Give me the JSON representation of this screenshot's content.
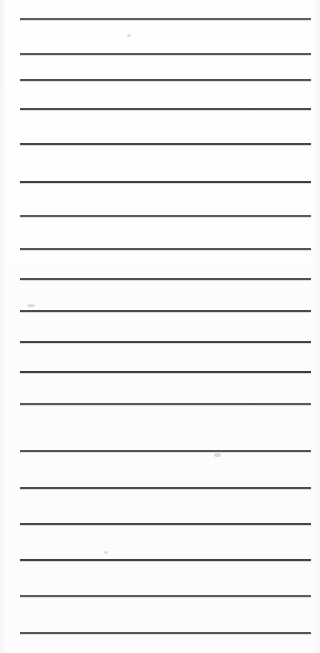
{
  "document": {
    "title": "Lined Notepaper Scan",
    "kind": "ruled-paper",
    "page_width": 320,
    "page_height": 653,
    "background_color": "#fefefe",
    "rule_color": "#3a3a3a",
    "text_content": "",
    "note": "Blank ruled sheet — no handwriting or printed text present"
  },
  "rules": {
    "count": 19,
    "left_x": 20,
    "right_x": 311,
    "thickness": 2,
    "positions": [
      18,
      53,
      79,
      108,
      143,
      181,
      215,
      248,
      278,
      310,
      341,
      371,
      403,
      450,
      487,
      523,
      559,
      595,
      632
    ]
  },
  "artifacts": [
    {
      "name": "scanner-smudge-left",
      "x": 27,
      "y": 304,
      "w": 8,
      "h": 3
    },
    {
      "name": "scanner-smudge-center",
      "x": 214,
      "y": 453,
      "w": 7,
      "h": 4
    },
    {
      "name": "scanner-speck-upper",
      "x": 127,
      "y": 34,
      "w": 4,
      "h": 3
    },
    {
      "name": "scanner-speck-lower",
      "x": 104,
      "y": 551,
      "w": 4,
      "h": 3
    }
  ]
}
